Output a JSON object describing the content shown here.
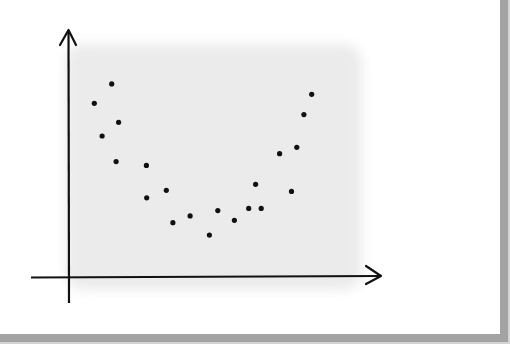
{
  "chart_data": {
    "type": "scatter",
    "title": "",
    "xlabel": "",
    "ylabel": "",
    "xlim": [
      0,
      10
    ],
    "ylim": [
      0,
      10
    ],
    "grid": false,
    "legend": null,
    "colors": {
      "points": "#111111",
      "axes": "#111111",
      "plot_background": "#ebebeb",
      "frame": "#a3a3a3"
    },
    "points": [
      {
        "x": 0.81,
        "y": 7.9
      },
      {
        "x": 1.37,
        "y": 8.78
      },
      {
        "x": 1.06,
        "y": 6.42
      },
      {
        "x": 1.59,
        "y": 7.04
      },
      {
        "x": 1.51,
        "y": 5.26
      },
      {
        "x": 2.48,
        "y": 5.09
      },
      {
        "x": 2.49,
        "y": 3.62
      },
      {
        "x": 3.12,
        "y": 3.96
      },
      {
        "x": 3.33,
        "y": 2.49
      },
      {
        "x": 3.88,
        "y": 2.8
      },
      {
        "x": 4.5,
        "y": 1.93
      },
      {
        "x": 4.77,
        "y": 3.04
      },
      {
        "x": 5.3,
        "y": 2.6
      },
      {
        "x": 5.76,
        "y": 3.14
      },
      {
        "x": 5.98,
        "y": 4.23
      },
      {
        "x": 6.16,
        "y": 3.14
      },
      {
        "x": 6.75,
        "y": 5.62
      },
      {
        "x": 7.13,
        "y": 3.91
      },
      {
        "x": 7.3,
        "y": 5.91
      },
      {
        "x": 7.53,
        "y": 7.39
      },
      {
        "x": 7.78,
        "y": 8.31
      }
    ]
  }
}
